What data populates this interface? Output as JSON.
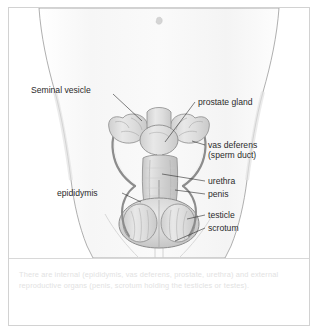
{
  "figure": {
    "labels": [
      {
        "id": "seminal-vesicle",
        "text": "Seminal vesicle",
        "side": "left"
      },
      {
        "id": "prostate-gland",
        "text": "prostate gland",
        "side": "right"
      },
      {
        "id": "vas-deferens-line1",
        "text": "vas deferens",
        "side": "right"
      },
      {
        "id": "vas-deferens-line2",
        "text": "(sperm duct)",
        "side": "right"
      },
      {
        "id": "urethra",
        "text": "urethra",
        "side": "right"
      },
      {
        "id": "penis",
        "text": "penis",
        "side": "right"
      },
      {
        "id": "epididymis",
        "text": "epididymis",
        "side": "left"
      },
      {
        "id": "testicle",
        "text": "testicle",
        "side": "right"
      },
      {
        "id": "scrotum",
        "text": "scrotum",
        "side": "right"
      }
    ],
    "colors": {
      "label_text": "#2b2b2b",
      "leader_line": "#2b2b2b",
      "body_outline": "#9a9a9a",
      "organ_outline": "#8c8c8c",
      "organ_fill": "#d9d9d9",
      "skin_fill": "#fbfbfb",
      "card_border": "#d2d2d2",
      "divider": "#d8d8d8",
      "caption_text": "#e2e2e2"
    }
  },
  "caption": {
    "text": "There are internal (epididymis, vas deferens, prostate, urethra) and external reproductive organs (penis, scrotum holding the testicles or testes)."
  }
}
